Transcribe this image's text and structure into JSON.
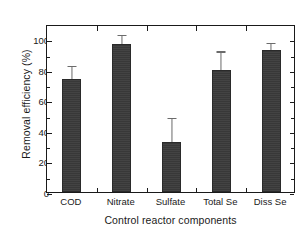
{
  "chart_data": {
    "type": "bar",
    "title": "",
    "subtitle": "",
    "xlabel": "Control reactor components",
    "ylabel": "Removal efficiency (%)",
    "categories": [
      "COD",
      "Nitrate",
      "Sulfate",
      "Total Se",
      "Diss Se"
    ],
    "values": [
      73.8,
      96.8,
      32.6,
      79.8,
      92.7
    ],
    "errors_upper": [
      8.6,
      6.0,
      15.8,
      12.2,
      4.8
    ],
    "errors_lower": [
      0,
      0,
      0,
      0,
      0
    ],
    "ylim": [
      0,
      110
    ],
    "ytick_labels": [
      "0",
      "20",
      "40",
      "60",
      "80",
      "100"
    ],
    "ytick_values": [
      0,
      20,
      40,
      60,
      80,
      100
    ],
    "yminor_values": [
      10,
      30,
      50,
      70,
      90
    ],
    "grid": false,
    "legend": null,
    "legend_position": "none",
    "bar_color": "#3b3b3b",
    "error_color": "#6b6b6b",
    "axis_color": "#1a1a1a",
    "background": "#ffffff",
    "series": [
      {
        "name": "Removal efficiency",
        "values": [
          73.8,
          96.8,
          32.6,
          79.8,
          92.7
        ]
      }
    ]
  }
}
